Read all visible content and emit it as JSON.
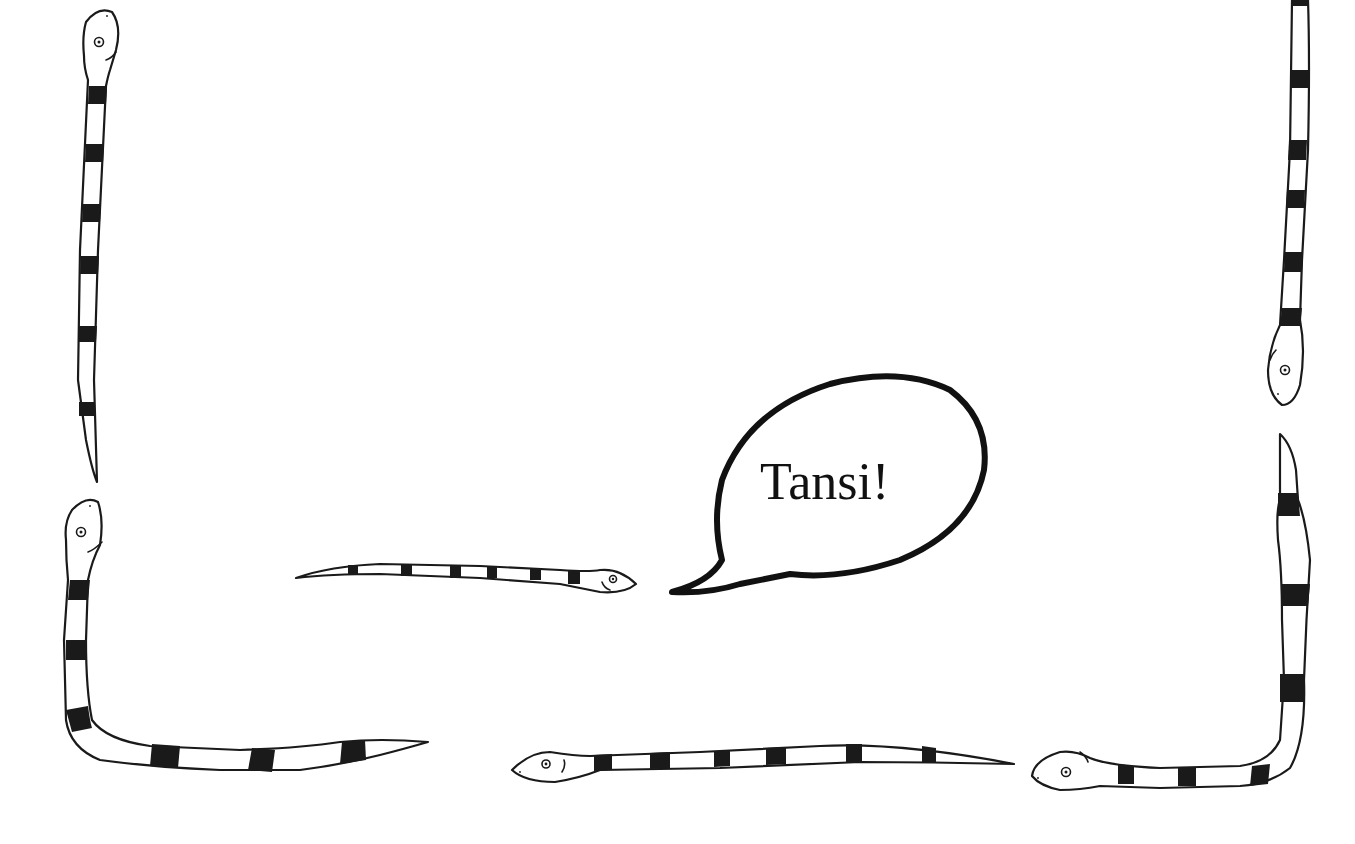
{
  "illustration": {
    "title": "Snake border with speech bubble",
    "speech_bubble": {
      "text": "Tansi!"
    },
    "snakes": [
      {
        "id": "top-left",
        "orientation": "vertical",
        "head": "up"
      },
      {
        "id": "top-right",
        "orientation": "vertical",
        "head": "down"
      },
      {
        "id": "bottom-left",
        "orientation": "L-shape",
        "head": "up"
      },
      {
        "id": "middle",
        "orientation": "horizontal",
        "head": "right"
      },
      {
        "id": "bottom-center",
        "orientation": "horizontal",
        "head": "left"
      },
      {
        "id": "bottom-right",
        "orientation": "L-shape",
        "head": "left"
      }
    ],
    "colors": {
      "ink": "#1a1a1a",
      "background": "#ffffff"
    }
  }
}
